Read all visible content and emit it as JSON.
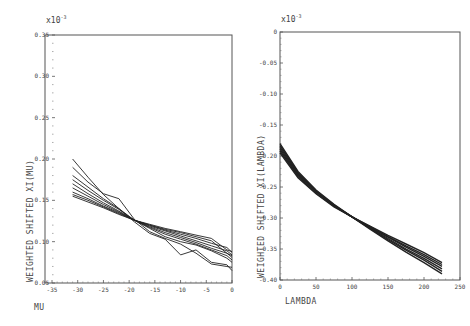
{
  "chart_data": [
    {
      "type": "line",
      "title": "",
      "multiplier_label": "x 10^-3",
      "multiplier_text": "x10",
      "multiplier_exp": "-3",
      "xlabel": "MU",
      "ylabel": "WEIGHTED SHIFTED XI(MU)",
      "xlim": [
        -35,
        0
      ],
      "ylim": [
        0.05,
        0.35
      ],
      "xticks": [
        "-35",
        "-30",
        "-25",
        "-20",
        "-15",
        "-10",
        "-5",
        "0"
      ],
      "xtick_values": [
        -35,
        -30,
        -25,
        -20,
        -15,
        -10,
        -5,
        0
      ],
      "yticks": [
        "0.05",
        "0.10",
        "0.15",
        "0.20",
        "0.25",
        "0.30",
        "0.35"
      ],
      "ytick_values": [
        0.05,
        0.1,
        0.15,
        0.2,
        0.25,
        0.3,
        0.35
      ],
      "grid": false,
      "legend": null,
      "x": [
        -31,
        -28,
        -25,
        -22,
        -19,
        -16,
        -13,
        -10,
        -7,
        -4,
        -1,
        0
      ],
      "series": [
        {
          "name": "curve 1",
          "values": [
            0.2,
            0.178,
            0.157,
            0.14,
            0.124,
            0.11,
            0.103,
            0.084,
            0.09,
            0.075,
            0.072,
            0.065
          ]
        },
        {
          "name": "curve 2",
          "values": [
            0.19,
            0.172,
            0.158,
            0.152,
            0.127,
            0.112,
            0.104,
            0.097,
            0.086,
            0.073,
            0.07,
            0.069
          ]
        },
        {
          "name": "curve 3",
          "values": [
            0.18,
            0.166,
            0.152,
            0.14,
            0.126,
            0.116,
            0.106,
            0.1,
            0.096,
            0.089,
            0.08,
            0.075
          ]
        },
        {
          "name": "curve 4",
          "values": [
            0.175,
            0.162,
            0.15,
            0.139,
            0.126,
            0.117,
            0.109,
            0.103,
            0.097,
            0.09,
            0.083,
            0.078
          ]
        },
        {
          "name": "curve 5",
          "values": [
            0.17,
            0.158,
            0.147,
            0.137,
            0.126,
            0.118,
            0.111,
            0.105,
            0.099,
            0.092,
            0.086,
            0.081
          ]
        },
        {
          "name": "curve 6",
          "values": [
            0.165,
            0.155,
            0.145,
            0.136,
            0.126,
            0.119,
            0.113,
            0.107,
            0.101,
            0.095,
            0.089,
            0.084
          ]
        },
        {
          "name": "curve 7",
          "values": [
            0.16,
            0.152,
            0.143,
            0.135,
            0.126,
            0.12,
            0.114,
            0.109,
            0.104,
            0.098,
            0.093,
            0.087
          ]
        },
        {
          "name": "curve 8",
          "values": [
            0.157,
            0.15,
            0.142,
            0.134,
            0.126,
            0.12,
            0.115,
            0.111,
            0.106,
            0.101,
            0.086,
            0.083
          ]
        },
        {
          "name": "curve 9",
          "values": [
            0.155,
            0.148,
            0.141,
            0.133,
            0.126,
            0.121,
            0.116,
            0.112,
            0.108,
            0.104,
            0.09,
            0.088
          ]
        }
      ]
    },
    {
      "type": "line",
      "title": "",
      "multiplier_label": "x 10^-3",
      "multiplier_text": "x10",
      "multiplier_exp": "-3",
      "xlabel": "LAMBDA",
      "ylabel": "WEIGHTED SHIFTED XI(LAMBDA)",
      "xlim": [
        0,
        250
      ],
      "ylim": [
        -0.4,
        0
      ],
      "xticks": [
        "0",
        "50",
        "100",
        "150",
        "200",
        "250"
      ],
      "xtick_values": [
        0,
        50,
        100,
        150,
        200,
        250
      ],
      "yticks": [
        "-0.40",
        "-0.35",
        "-0.30",
        "-0.25",
        "-0.20",
        "-0.15",
        "-0.10",
        "-0.05",
        "0"
      ],
      "ytick_values": [
        -0.4,
        -0.35,
        -0.3,
        -0.25,
        -0.2,
        -0.15,
        -0.1,
        -0.05,
        0
      ],
      "grid": false,
      "legend": null,
      "x": [
        0,
        25,
        50,
        75,
        100,
        125,
        150,
        175,
        200,
        225
      ],
      "series": [
        {
          "name": "curve 1",
          "values": [
            -0.18,
            -0.225,
            -0.255,
            -0.278,
            -0.298,
            -0.318,
            -0.337,
            -0.355,
            -0.372,
            -0.39
          ]
        },
        {
          "name": "curve 2",
          "values": [
            -0.183,
            -0.227,
            -0.256,
            -0.279,
            -0.298,
            -0.317,
            -0.335,
            -0.352,
            -0.368,
            -0.386
          ]
        },
        {
          "name": "curve 3",
          "values": [
            -0.186,
            -0.229,
            -0.257,
            -0.28,
            -0.298,
            -0.316,
            -0.333,
            -0.35,
            -0.365,
            -0.382
          ]
        },
        {
          "name": "curve 4",
          "values": [
            -0.189,
            -0.231,
            -0.258,
            -0.28,
            -0.298,
            -0.315,
            -0.331,
            -0.347,
            -0.362,
            -0.378
          ]
        },
        {
          "name": "curve 5",
          "values": [
            -0.192,
            -0.233,
            -0.26,
            -0.281,
            -0.298,
            -0.314,
            -0.33,
            -0.345,
            -0.359,
            -0.375
          ]
        },
        {
          "name": "curve 6",
          "values": [
            -0.195,
            -0.235,
            -0.261,
            -0.282,
            -0.298,
            -0.313,
            -0.328,
            -0.342,
            -0.356,
            -0.372
          ]
        }
      ]
    }
  ]
}
